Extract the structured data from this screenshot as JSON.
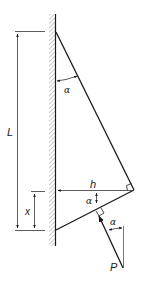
{
  "diagram": {
    "type": "mechanics-free-body",
    "labels": {
      "length": "L",
      "offset": "x",
      "height": "h",
      "angle_top": "α",
      "angle_lower": "α",
      "angle_force": "α",
      "force": "P"
    },
    "colors": {
      "line": "#1a1a1a",
      "hatch": "#9a9a9a",
      "dimension": "#333333",
      "background": "#ffffff"
    }
  }
}
